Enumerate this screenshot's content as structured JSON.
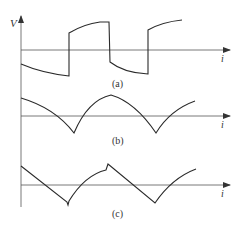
{
  "figure": {
    "y_axis_label": "V",
    "x_axis_label": "i",
    "colors": {
      "line": "#2a2a2a",
      "axis": "#555555",
      "text": "#333333"
    },
    "panels": [
      {
        "id": "a",
        "caption": "(a)",
        "description": "square-like wave with exponential segments"
      },
      {
        "id": "b",
        "caption": "(b)",
        "description": "rectified arc wave with cusps below axis"
      },
      {
        "id": "c",
        "caption": "(c)",
        "description": "sawtooth-like wave with linear falls and curved rises"
      }
    ]
  }
}
